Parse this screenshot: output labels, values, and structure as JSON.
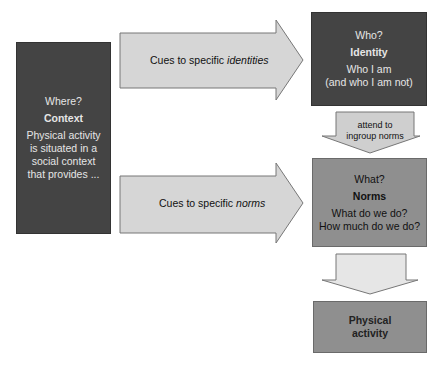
{
  "context": {
    "question": "Where?",
    "title": "Context",
    "lines": [
      "Physical activity",
      "is situated in a",
      "social context",
      "that provides ..."
    ]
  },
  "identity": {
    "question": "Who?",
    "title": "Identity",
    "lines": [
      "Who I am",
      "(and who I am not)"
    ]
  },
  "norms": {
    "question": "What?",
    "title": "Norms",
    "lines": [
      "What do we do?",
      "How much do we do?"
    ]
  },
  "activity": {
    "title_lines": [
      "Physical",
      "activity"
    ]
  },
  "arrows": {
    "identity_cue": {
      "prefix": "Cues to specific ",
      "emphasis": "identities"
    },
    "norms_cue": {
      "prefix": "Cues to specific ",
      "emphasis": "norms"
    },
    "attend": {
      "lines": [
        "attend to",
        "ingroup norms"
      ]
    }
  },
  "colors": {
    "dark_box": "#444444",
    "mid_box": "#8f8f8f",
    "arrow_fill": "#d6d6d6",
    "arrow_light_fill": "#e6e6e6"
  }
}
